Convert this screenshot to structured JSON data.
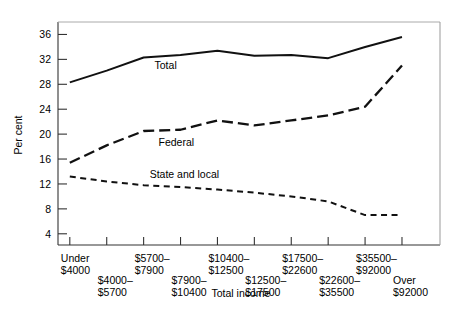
{
  "chart_data": {
    "type": "line",
    "title": "",
    "xlabel": "Total income",
    "ylabel": "Per cent",
    "ylim": [
      2.2,
      38
    ],
    "yticks": [
      4,
      8,
      12,
      16,
      20,
      24,
      28,
      32,
      36
    ],
    "ytick_labels": [
      "4",
      "8",
      "12",
      "16",
      "20",
      "24",
      "28",
      "32",
      "36"
    ],
    "grid": false,
    "legend_position": "inline-labels",
    "categories": [
      "Under\n$4000",
      "$4000–\n$5700",
      "$5700–\n$7900",
      "$7900–\n$10400",
      "$10400–\n$12500",
      "$12500–\n$17500",
      "$17500–\n$22600",
      "$22600–\n$35500",
      "$35500–\n$92000",
      "Over\n$92000"
    ],
    "category_lines": [
      [
        "Under",
        "$4000"
      ],
      [
        "$4000–",
        "$5700"
      ],
      [
        "$5700–",
        "$7900"
      ],
      [
        "$7900–",
        "$10400"
      ],
      [
        "$10400–",
        "$12500"
      ],
      [
        "$12500–",
        "$17500"
      ],
      [
        "$17500–",
        "$22600"
      ],
      [
        "$22600–",
        "$35500"
      ],
      [
        "$35500–",
        "$92000"
      ],
      [
        "Over",
        "$92000"
      ]
    ],
    "series": [
      {
        "name": "Total",
        "style": "solid",
        "values": [
          28.3,
          30.2,
          32.3,
          32.7,
          33.4,
          32.6,
          32.7,
          32.2,
          34.0,
          35.6
        ]
      },
      {
        "name": "Federal",
        "style": "long-dash",
        "values": [
          15.4,
          18.2,
          20.5,
          20.7,
          22.2,
          21.4,
          22.2,
          23.0,
          24.4,
          31.0
        ]
      },
      {
        "name": "State and local",
        "style": "short-dash",
        "values": [
          13.2,
          12.4,
          11.8,
          11.5,
          11.1,
          10.6,
          10.0,
          9.2,
          7.0,
          7.0
        ]
      }
    ],
    "annotations": [
      {
        "text": "Total",
        "series": "Total"
      },
      {
        "text": "Federal",
        "series": "Federal"
      },
      {
        "text": "State and local",
        "series": "State and local"
      }
    ],
    "colors": {
      "line": "#111111",
      "axis": "#444444",
      "background": "#ffffff"
    }
  }
}
